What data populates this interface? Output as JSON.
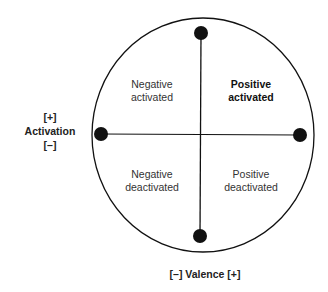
{
  "diagram": {
    "quadrants": {
      "top_left": "Negative\nactivated",
      "top_right": "Positive\nactivated",
      "bottom_left": "Negative\ndeactivated",
      "bottom_right": "Positive\ndeactivated"
    },
    "quadrant_lines": {
      "top_left": [
        "Negative",
        "activated"
      ],
      "top_right": [
        "Positive",
        "activated"
      ],
      "bottom_left": [
        "Negative",
        "deactivated"
      ],
      "bottom_right": [
        "Positive",
        "deactivated"
      ]
    },
    "y_axis": {
      "top": "[+]",
      "label": "Activation",
      "bottom": "[–]"
    },
    "x_axis": {
      "label": "[–] Valence [+]"
    },
    "colors": {
      "stroke": "#111111",
      "background": "#ffffff"
    }
  }
}
